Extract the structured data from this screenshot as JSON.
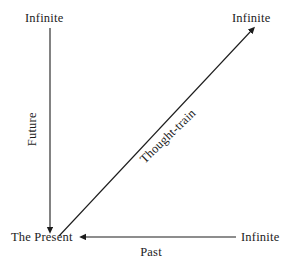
{
  "diagram": {
    "background_color": "#ffffff",
    "stroke_color": "#1c1c1c",
    "text_color": "#1c1c1c",
    "labels": {
      "infinite_top_left": "Infinite",
      "infinite_top_right": "Infinite",
      "infinite_bottom_right": "Infinite",
      "origin": "The Present",
      "future_axis": "Future",
      "past_axis": "Past",
      "diagonal_axis": "Thought-train"
    },
    "axes": [
      {
        "name": "future-axis",
        "label": "Future",
        "from_label": "Infinite",
        "to_label": "The Present",
        "direction": "downward",
        "arrowhead_at": "The Present",
        "x1": 50,
        "y1": 28,
        "x2": 50,
        "y2": 228
      },
      {
        "name": "past-axis",
        "label": "Past",
        "from_label": "Infinite",
        "to_label": "The Present",
        "direction": "leftward",
        "arrowhead_at": "The Present",
        "x1": 236,
        "y1": 237,
        "x2": 85,
        "y2": 237
      },
      {
        "name": "thought-train-axis",
        "label": "Thought-train",
        "from_label": "The Present",
        "to_label": "Infinite",
        "direction": "up-right diagonal",
        "arrowhead_at": "Infinite",
        "x1": 59,
        "y1": 236,
        "x2": 253,
        "y2": 29
      }
    ]
  }
}
